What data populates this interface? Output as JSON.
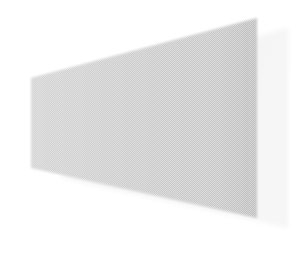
{
  "canvas": {
    "width": 296,
    "height": 262,
    "background_color": "#ffffff",
    "description": "Abstract grayscale perspective wedge / quadrilateral with soft drop shadow on a plain white field"
  },
  "figure": {
    "name": "perspective-wedge",
    "fill_color": "#cdcdcd",
    "fill_color_light": "#d6d6d6",
    "fill_color_dark": "#c2c2c2",
    "edge_color": "#bdbdbd",
    "texture": "dithered-halftone",
    "opacity": 1,
    "vertices": [
      {
        "x": 31,
        "y": 78
      },
      {
        "x": 257,
        "y": 18
      },
      {
        "x": 257,
        "y": 218
      },
      {
        "x": 31,
        "y": 168
      }
    ],
    "points_attr": "31,78 257,18 257,218 31,168"
  },
  "seam": {
    "name": "vertical-seam",
    "color": "#dcdcdc",
    "x": 214,
    "y_top": 26,
    "y_bottom": 214,
    "width": 2
  },
  "shadow": {
    "name": "drop-shadow",
    "fill_color": "#f1f1f1",
    "fill_color_soft": "#f7f7f7",
    "offset_x": 31,
    "offset_y": 10,
    "vertices": [
      {
        "x": 62,
        "y": 88
      },
      {
        "x": 288,
        "y": 28
      },
      {
        "x": 288,
        "y": 228
      },
      {
        "x": 62,
        "y": 178
      }
    ],
    "points_attr": "62,88 288,28 288,228 62,178"
  },
  "gradient": {
    "name": "wedge-shading",
    "stops": [
      {
        "offset": "0%",
        "color": "#d4d4d4"
      },
      {
        "offset": "45%",
        "color": "#cdcdcd"
      },
      {
        "offset": "82%",
        "color": "#c9c9c9"
      },
      {
        "offset": "100%",
        "color": "#c0c0c0"
      }
    ]
  }
}
